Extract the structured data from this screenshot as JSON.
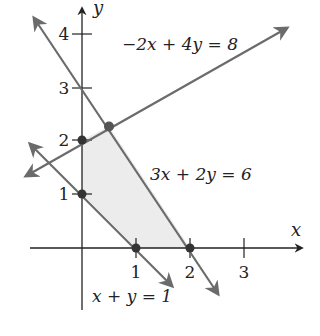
{
  "figure": {
    "type": "linear-programming feasible region",
    "axes": {
      "x_label": "x",
      "y_label": "y",
      "x_ticks": [
        "1",
        "2",
        "3"
      ],
      "y_ticks": [
        "1",
        "2",
        "3",
        "4"
      ]
    },
    "lines": [
      {
        "equation": "−2x + 4y = 8",
        "label": "−2x + 4y = 8"
      },
      {
        "equation": "3x + 2y = 6",
        "label": "3x + 2y = 6"
      },
      {
        "equation": "x + y = 1",
        "label": "x + y = 1"
      }
    ],
    "vertices": [
      {
        "x": 0,
        "y": 1
      },
      {
        "x": 0,
        "y": 2
      },
      {
        "x": 0.5,
        "y": 2.25
      },
      {
        "x": 2,
        "y": 0
      },
      {
        "x": 1,
        "y": 0
      }
    ],
    "colors": {
      "line": "#6b6b6b",
      "axis": "#222222",
      "region_fill": "#ececec",
      "point": "#333333"
    }
  }
}
